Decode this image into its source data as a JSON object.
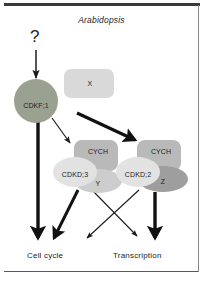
{
  "figure": {
    "title": "Arabidopsis",
    "unknown_input_marker": "?",
    "nodes": {
      "cdkf1": {
        "label": "CDKF;1",
        "shape": "circle",
        "color": "#9aa191"
      },
      "x": {
        "label": "X",
        "shape": "rounded-rect",
        "color": "#d9d9d9"
      },
      "cych_left": {
        "label": "CYCH",
        "shape": "rounded-rect",
        "color": "#bdbdbd"
      },
      "cdkd3": {
        "label": "CDKD;3",
        "shape": "ellipse",
        "color": "#e0e0e0"
      },
      "y": {
        "label": "Y",
        "shape": "ellipse",
        "color": "#cfcfcf"
      },
      "cych_right": {
        "label": "CYCH",
        "shape": "rounded-rect",
        "color": "#bdbdbd"
      },
      "cdkd2": {
        "label": "CDKD;2",
        "shape": "ellipse",
        "color": "#e0e0e0"
      },
      "z": {
        "label": "Z",
        "shape": "ellipse",
        "color": "#9e9e9e"
      }
    },
    "outcomes": {
      "cell_cycle": "Cell cycle",
      "transcription": "Transcription"
    },
    "edges": [
      {
        "from": "?",
        "to": "CDKF;1",
        "weight": "thin"
      },
      {
        "from": "CDKF;1",
        "to": "Cell cycle",
        "weight": "thick"
      },
      {
        "from": "CDKF;1",
        "to": "CDKD;3 complex",
        "weight": "thin"
      },
      {
        "from": "CDKF;1",
        "to": "CDKD;2 complex",
        "weight": "thick"
      },
      {
        "from": "CDKD;3 complex",
        "to": "Cell cycle",
        "weight": "thick"
      },
      {
        "from": "CDKD;3 complex",
        "to": "Transcription",
        "weight": "thin"
      },
      {
        "from": "CDKD;2 complex",
        "to": "Cell cycle",
        "weight": "thin"
      },
      {
        "from": "CDKD;2 complex",
        "to": "Transcription",
        "weight": "thick"
      }
    ],
    "colors": {
      "ink": "#1c1c1c",
      "frame": "#3a3a3a",
      "background": "#ffffff"
    }
  }
}
